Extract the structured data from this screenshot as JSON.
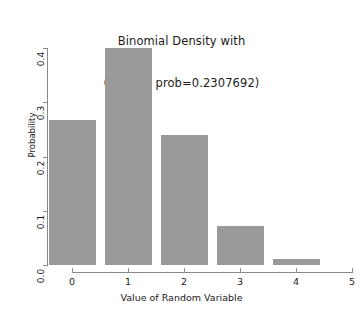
{
  "chart_data": {
    "type": "bar",
    "title": "Binomial Density with\n(size=5, prob=0.2307692)",
    "title_lines": [
      "Binomial Density with",
      "(size=5, prob=0.2307692)"
    ],
    "xlabel": "Value of Random Variable",
    "ylabel": "Probability",
    "categories": [
      "0",
      "1",
      "2",
      "3",
      "4"
    ],
    "values": [
      0.267,
      0.4,
      0.24,
      0.072,
      0.011
    ],
    "x": [
      0,
      1,
      2,
      3,
      4
    ],
    "xlim": [
      0,
      5
    ],
    "ylim": [
      0.0,
      0.4
    ],
    "xticks": [
      "0",
      "1",
      "2",
      "3",
      "4",
      "5"
    ],
    "yticks": [
      "0.0",
      "0.1",
      "0.2",
      "0.3",
      "0.4"
    ],
    "grid": false,
    "legend": null,
    "bar_color": "#9a9a9a",
    "axis_color": "#8a8a8a",
    "background": "#ffffff"
  }
}
